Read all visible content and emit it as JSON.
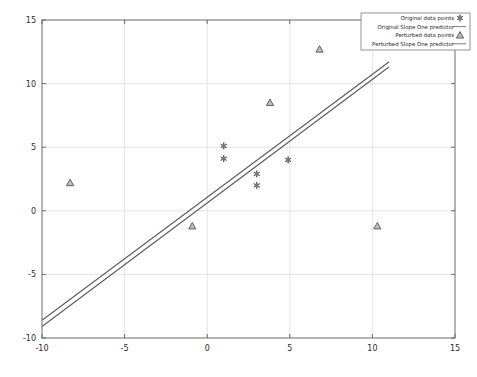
{
  "chart_data": {
    "type": "scatter",
    "title": "",
    "xlabel": "",
    "ylabel": "",
    "xlim": [
      -10,
      15
    ],
    "ylim": [
      -10,
      15
    ],
    "xticks": [
      -10,
      -5,
      0,
      5,
      10,
      15
    ],
    "yticks": [
      -10,
      -5,
      0,
      5,
      10,
      15
    ],
    "xticklabels": [
      "-10",
      "-5",
      "0",
      "5",
      "10",
      "15"
    ],
    "yticklabels": [
      "-10",
      "-5",
      "0",
      "5",
      "10",
      "15"
    ],
    "grid": true,
    "legend_position": "upper right",
    "series": [
      {
        "name": "Original data points",
        "marker": "asterisk",
        "type": "scatter",
        "points": [
          {
            "x": 1.0,
            "y": 5.1
          },
          {
            "x": 1.0,
            "y": 4.1
          },
          {
            "x": 3.0,
            "y": 2.9
          },
          {
            "x": 3.0,
            "y": 2.0
          },
          {
            "x": 4.9,
            "y": 4.0
          }
        ]
      },
      {
        "name": "Original Slope One predictor",
        "marker": "line",
        "type": "line",
        "endpoints": [
          {
            "x": -10.0,
            "y": -8.6
          },
          {
            "x": 11.0,
            "y": 11.7
          }
        ]
      },
      {
        "name": "Perturbed data points",
        "marker": "triangle",
        "type": "scatter",
        "points": [
          {
            "x": -8.3,
            "y": 2.2
          },
          {
            "x": -0.9,
            "y": -1.2
          },
          {
            "x": 3.8,
            "y": 8.5
          },
          {
            "x": 6.8,
            "y": 12.7
          },
          {
            "x": 10.3,
            "y": -1.2
          }
        ]
      },
      {
        "name": "Perturbed Slope One predictor",
        "marker": "line",
        "type": "line",
        "endpoints": [
          {
            "x": -10.0,
            "y": -9.1
          },
          {
            "x": 11.0,
            "y": 11.3
          }
        ]
      }
    ]
  },
  "legend": {
    "entries": [
      {
        "label": "Original data points",
        "marker": "asterisk"
      },
      {
        "label": "Original Slope One predictor",
        "marker": "line"
      },
      {
        "label": "Perturbed data points",
        "marker": "triangle"
      },
      {
        "label": "Perturbed Slope One predictor",
        "marker": "line"
      }
    ]
  },
  "colors": {
    "axis": "#6b6b6b",
    "grid": "#d8d8d8",
    "line": "#5a5a5a",
    "marker_edge": "#555555",
    "marker_fill": "#bdbdbd",
    "background": "#ffffff"
  }
}
